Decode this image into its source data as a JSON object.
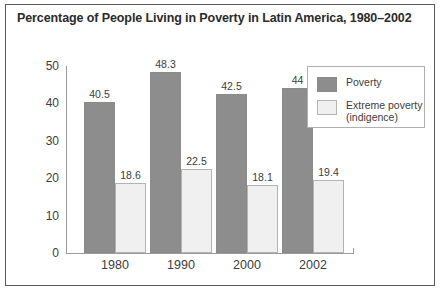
{
  "chart_data": {
    "type": "bar",
    "title": "Percentage of People Living in Poverty in Latin America, 1980–2002",
    "xlabel": "",
    "ylabel": "",
    "ylim": [
      0,
      50
    ],
    "yticks": [
      0,
      10,
      20,
      30,
      40,
      50
    ],
    "ytick_labels": [
      "0",
      "10",
      "20",
      "30",
      "40",
      "50"
    ],
    "grid": false,
    "legend_position": "top-right",
    "categories": [
      "1980",
      "1990",
      "2000",
      "2002"
    ],
    "series": [
      {
        "name": "Poverty",
        "color": "#8d8d8d",
        "values": [
          40.5,
          48.3,
          42.5,
          44
        ],
        "labels": [
          "40.5",
          "48.3",
          "42.5",
          "44"
        ]
      },
      {
        "name": "Extreme poverty (indigence)",
        "name_line1": "Extreme poverty",
        "name_line2": "(indigence)",
        "color": "#f0f0f0",
        "values": [
          18.6,
          22.5,
          18.1,
          19.4
        ],
        "labels": [
          "18.6",
          "22.5",
          "18.1",
          "19.4"
        ]
      }
    ]
  }
}
